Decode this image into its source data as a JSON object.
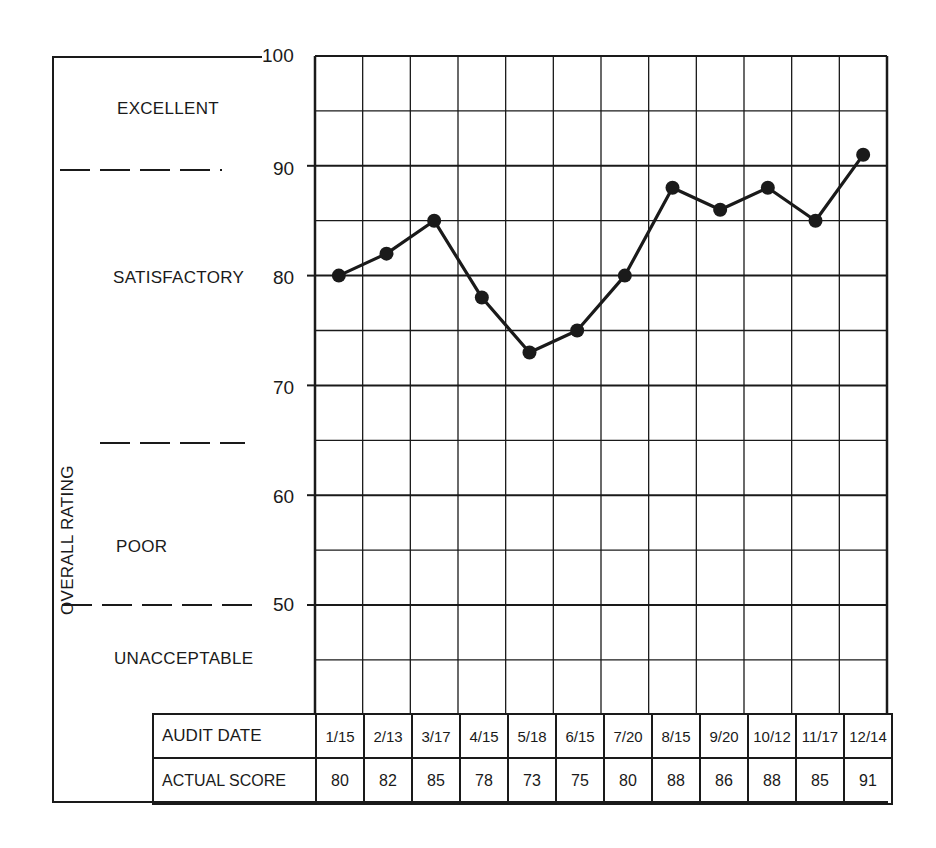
{
  "chart_data": {
    "type": "line",
    "title": "",
    "xlabel": "AUDIT DATE",
    "ylabel": "OVERALL RATING",
    "ylim": [
      50,
      100
    ],
    "yticks": [
      50,
      60,
      70,
      80,
      90,
      100
    ],
    "grid": true,
    "legend": null,
    "categories": [
      "1/15",
      "2/13",
      "3/17",
      "4/15",
      "5/18",
      "6/15",
      "7/20",
      "8/15",
      "9/20",
      "10/12",
      "11/17",
      "12/14"
    ],
    "series": [
      {
        "name": "ACTUAL SCORE",
        "values": [
          80,
          82,
          85,
          78,
          73,
          75,
          80,
          88,
          86,
          88,
          85,
          91
        ]
      }
    ],
    "rating_zones": [
      {
        "label": "EXCELLENT",
        "range": [
          90,
          100
        ]
      },
      {
        "label": "SATISFACTORY",
        "range": [
          65,
          90
        ]
      },
      {
        "label": "POOR",
        "range": [
          50,
          65
        ]
      },
      {
        "label": "UNACCEPTABLE",
        "range": [
          null,
          50
        ]
      }
    ]
  },
  "axis": {
    "ylabel": "OVERALL RATING",
    "ticks": [
      "100",
      "90",
      "80",
      "70",
      "60",
      "50"
    ]
  },
  "zones": {
    "excellent": "EXCELLENT",
    "satisfactory": "SATISFACTORY",
    "poor": "POOR",
    "unacceptable": "UNACCEPTABLE"
  },
  "table": {
    "date_header": "AUDIT DATE",
    "score_header": "ACTUAL SCORE",
    "dates": [
      "1/15",
      "2/13",
      "3/17",
      "4/15",
      "5/18",
      "6/15",
      "7/20",
      "8/15",
      "9/20",
      "10/12",
      "11/17",
      "12/14"
    ],
    "scores": [
      "80",
      "82",
      "85",
      "78",
      "73",
      "75",
      "80",
      "88",
      "86",
      "88",
      "85",
      "91"
    ]
  },
  "colors": {
    "ink": "#1a1a1a",
    "paper": "#ffffff"
  }
}
